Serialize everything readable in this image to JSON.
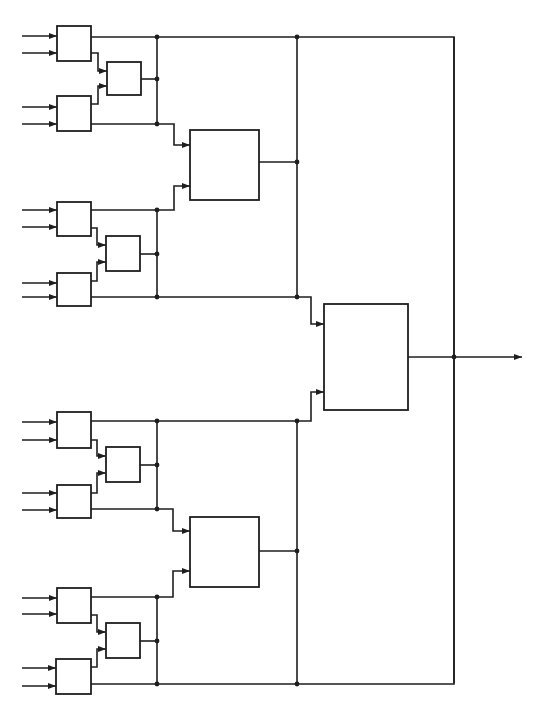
{
  "diagram": {
    "type": "block-diagram",
    "colors": {
      "line": "#1e1e1e",
      "background": "#ffffff"
    },
    "groups": [
      {
        "id": "group-1",
        "blocks": [
          {
            "id": "g1-a",
            "x": 57,
            "y": 26,
            "w": 34,
            "h": 35,
            "inputs": [
              36,
              53
            ]
          },
          {
            "id": "g1-b",
            "x": 107,
            "y": 62,
            "w": 34,
            "h": 33
          },
          {
            "id": "g1-c",
            "x": 57,
            "y": 96,
            "w": 34,
            "h": 35,
            "inputs": [
              107,
              124
            ]
          }
        ],
        "bus_x": 157,
        "taps": [
          37,
          79,
          124
        ]
      },
      {
        "id": "group-2",
        "blocks": [
          {
            "id": "g2-a",
            "x": 57,
            "y": 202,
            "w": 34,
            "h": 34,
            "inputs": [
              210,
              227
            ]
          },
          {
            "id": "g2-b",
            "x": 106,
            "y": 236,
            "w": 34,
            "h": 35
          },
          {
            "id": "g2-c",
            "x": 57,
            "y": 273,
            "w": 34,
            "h": 33,
            "inputs": [
              283,
              297
            ]
          }
        ],
        "bus_x": 157,
        "taps": [
          210,
          254,
          297
        ]
      },
      {
        "id": "group-3",
        "blocks": [
          {
            "id": "g3-a",
            "x": 57,
            "y": 412,
            "w": 34,
            "h": 36,
            "inputs": [
              422,
              440
            ]
          },
          {
            "id": "g3-b",
            "x": 106,
            "y": 447,
            "w": 34,
            "h": 35
          },
          {
            "id": "g3-c",
            "x": 57,
            "y": 485,
            "w": 34,
            "h": 33,
            "inputs": [
              493,
              510
            ]
          }
        ],
        "bus_x": 157,
        "taps": [
          421,
          465,
          509
        ]
      },
      {
        "id": "group-4",
        "blocks": [
          {
            "id": "g4-a",
            "x": 57,
            "y": 588,
            "w": 34,
            "h": 35,
            "inputs": [
              598,
              614
            ]
          },
          {
            "id": "g4-b",
            "x": 106,
            "y": 623,
            "w": 34,
            "h": 35
          },
          {
            "id": "g4-c",
            "x": 56,
            "y": 659,
            "w": 35,
            "h": 35,
            "inputs": [
              668,
              686
            ]
          }
        ],
        "bus_x": 157,
        "taps": [
          597,
          641,
          684
        ]
      }
    ],
    "intermediate_blocks": [
      {
        "id": "mid-upper",
        "x": 190,
        "y": 130,
        "w": 69,
        "h": 70,
        "output_y": 162
      },
      {
        "id": "mid-lower",
        "x": 190,
        "y": 517,
        "w": 69,
        "h": 70,
        "output_y": 551
      }
    ],
    "final_block": {
      "id": "final",
      "x": 324,
      "y": 304,
      "w": 84,
      "h": 106,
      "output_y": 357
    },
    "output_arrow_tip_x": 522,
    "right_bus_x": 454,
    "node_count": {
      "input_blocks": 12,
      "intermediate_blocks": 2,
      "final_blocks": 1,
      "external_inputs": 16,
      "outputs": 1
    }
  }
}
